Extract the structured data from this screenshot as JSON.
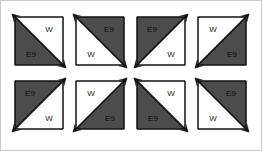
{
  "canvas": {
    "width": 262,
    "height": 151,
    "background": "#ffffff",
    "border_color": "#c9c9c9"
  },
  "palette": {
    "dark_fill": "#4c4c4c",
    "light_fill": "#ffffff",
    "line": "#111111",
    "label_text": "#1a1a1a"
  },
  "legend": {
    "dark_label": "E9",
    "light_label": "W"
  },
  "grid": {
    "rows": 2,
    "cols": 4,
    "cell_size": 48
  },
  "units": [
    {
      "id": "unit-1",
      "row": 0,
      "col": 0,
      "x": 14,
      "y": 16,
      "diagonal": "tl-br",
      "dark_half": "lower-left",
      "dark_label": "E9",
      "light_label": "W",
      "dark_label_x": 16,
      "dark_label_y": 38,
      "light_label_x": 34,
      "light_label_y": 13
    },
    {
      "id": "unit-2",
      "row": 0,
      "col": 1,
      "x": 75,
      "y": 16,
      "diagonal": "tl-br",
      "dark_half": "upper-right",
      "dark_label": "E9",
      "light_label": "W",
      "dark_label_x": 33,
      "dark_label_y": 13,
      "light_label_x": 15,
      "light_label_y": 38
    },
    {
      "id": "unit-3",
      "row": 0,
      "col": 2,
      "x": 136,
      "y": 16,
      "diagonal": "bl-tr",
      "dark_half": "upper-left",
      "dark_label": "E9",
      "light_label": "W",
      "dark_label_x": 15,
      "dark_label_y": 13,
      "light_label_x": 34,
      "light_label_y": 38
    },
    {
      "id": "unit-4",
      "row": 0,
      "col": 3,
      "x": 197,
      "y": 16,
      "diagonal": "bl-tr",
      "dark_half": "lower-right",
      "dark_label": "E9",
      "light_label": "W",
      "dark_label_x": 34,
      "dark_label_y": 38,
      "light_label_x": 15,
      "light_label_y": 13
    },
    {
      "id": "unit-5",
      "row": 1,
      "col": 0,
      "x": 14,
      "y": 80,
      "diagonal": "bl-tr",
      "dark_half": "upper-left",
      "dark_label": "E9",
      "light_label": "W",
      "dark_label_x": 15,
      "dark_label_y": 13,
      "light_label_x": 34,
      "light_label_y": 38
    },
    {
      "id": "unit-6",
      "row": 1,
      "col": 1,
      "x": 75,
      "y": 80,
      "diagonal": "bl-tr",
      "dark_half": "lower-right",
      "dark_label": "E9",
      "light_label": "W",
      "dark_label_x": 34,
      "dark_label_y": 38,
      "light_label_x": 15,
      "light_label_y": 13
    },
    {
      "id": "unit-7",
      "row": 1,
      "col": 2,
      "x": 136,
      "y": 80,
      "diagonal": "tl-br",
      "dark_half": "lower-left",
      "dark_label": "E9",
      "light_label": "W",
      "dark_label_x": 16,
      "dark_label_y": 38,
      "light_label_x": 34,
      "light_label_y": 13
    },
    {
      "id": "unit-8",
      "row": 1,
      "col": 3,
      "x": 197,
      "y": 80,
      "diagonal": "tl-br",
      "dark_half": "upper-right",
      "dark_label": "E9",
      "light_label": "W",
      "dark_label_x": 33,
      "dark_label_y": 13,
      "light_label_x": 15,
      "light_label_y": 38
    }
  ]
}
